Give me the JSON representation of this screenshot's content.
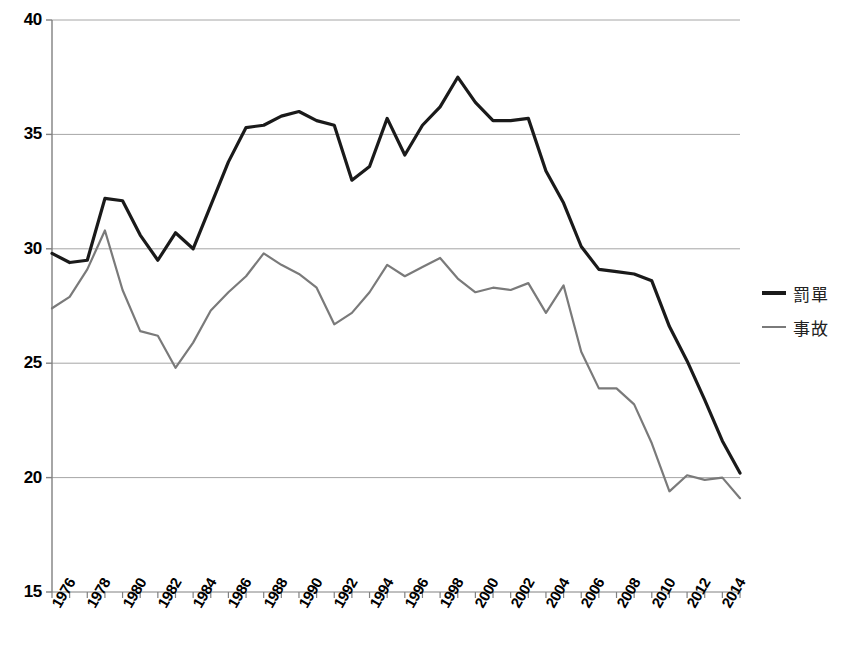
{
  "chart_data": {
    "type": "line",
    "title": "",
    "xlabel": "",
    "ylabel": "",
    "ylim": [
      15,
      40
    ],
    "xlim": [
      1976,
      2015
    ],
    "yticks": [
      15,
      20,
      25,
      30,
      35,
      40
    ],
    "ytick_labels": [
      "15",
      "20",
      "25",
      "30",
      "35",
      "40"
    ],
    "grid": true,
    "grid_axis": "y",
    "legend_position": "right",
    "x": [
      1976,
      1977,
      1978,
      1979,
      1980,
      1981,
      1982,
      1983,
      1984,
      1985,
      1986,
      1987,
      1988,
      1989,
      1990,
      1991,
      1992,
      1993,
      1994,
      1995,
      1996,
      1997,
      1998,
      1999,
      2000,
      2001,
      2002,
      2003,
      2004,
      2005,
      2006,
      2007,
      2008,
      2009,
      2010,
      2011,
      2012,
      2013,
      2014,
      2015
    ],
    "xtick_labels": [
      "1976",
      "1978",
      "1980",
      "1982",
      "1984",
      "1986",
      "1988",
      "1990",
      "1992",
      "1994",
      "1996",
      "1998",
      "2000",
      "2002",
      "2004",
      "2006",
      "2008",
      "2010",
      "2012",
      "2014"
    ],
    "xtick_values": [
      1976,
      1978,
      1980,
      1982,
      1984,
      1986,
      1988,
      1990,
      1992,
      1994,
      1996,
      1998,
      2000,
      2002,
      2004,
      2006,
      2008,
      2010,
      2012,
      2014
    ],
    "series": [
      {
        "name": "罰單",
        "color": "#1a1a1a",
        "width": 3.2,
        "values": [
          29.8,
          29.4,
          29.5,
          32.2,
          32.1,
          30.6,
          29.5,
          30.7,
          30.0,
          31.9,
          33.8,
          35.3,
          35.4,
          35.8,
          36.0,
          35.6,
          35.4,
          33.0,
          33.6,
          35.7,
          34.1,
          35.4,
          36.2,
          37.5,
          36.4,
          35.6,
          35.6,
          35.7,
          33.4,
          32.0,
          30.1,
          29.1,
          29.0,
          28.9,
          28.6,
          26.6,
          25.1,
          23.4,
          21.6,
          20.2
        ]
      },
      {
        "name": "事故",
        "color": "#7a7a7a",
        "width": 2.2,
        "values": [
          27.4,
          27.9,
          29.1,
          30.8,
          28.2,
          26.4,
          26.2,
          24.8,
          25.9,
          27.3,
          28.1,
          28.8,
          29.8,
          29.3,
          28.9,
          28.3,
          26.7,
          27.2,
          28.1,
          29.3,
          28.8,
          29.2,
          29.6,
          28.7,
          28.1,
          28.3,
          28.2,
          28.5,
          27.2,
          28.4,
          25.5,
          23.9,
          23.9,
          23.2,
          21.5,
          19.4,
          20.1,
          19.9,
          20.0,
          19.1
        ]
      }
    ],
    "axis": {
      "left_color": "#808080",
      "bottom_color": "#808080",
      "grid_color": "#a6a6a6"
    }
  },
  "legend": {
    "items": [
      {
        "label": "罰單",
        "color": "#1a1a1a"
      },
      {
        "label": "事故",
        "color": "#7a7a7a"
      }
    ]
  }
}
